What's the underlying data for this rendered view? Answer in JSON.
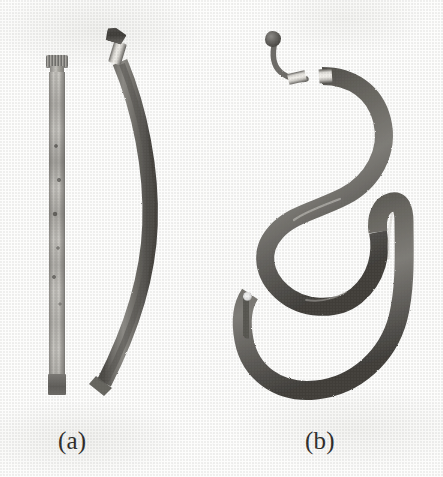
{
  "figure": {
    "kind": "grayscale-photograph-plate",
    "background_color": "#fdfdfc",
    "width": 443,
    "height": 477,
    "panels": [
      {
        "id": "a",
        "caption": "(a)",
        "objects": [
          {
            "name": "straight-rigid-rod",
            "description": "long slender straight tube / rod shown vertically, mottled grey metal surface with fine longitudinal striations and dark pitting spots",
            "orientation": "vertical",
            "features": [
              "knurled-threaded-cap-top",
              "narrow-neck",
              "striated-shaft",
              "blunt-dark-foot"
            ],
            "colors": {
              "shaft_light": "#cbc9c4",
              "shaft_mid": "#a8a6a1",
              "shaft_dark": "#76746f",
              "cap": "#8a8884",
              "foot": "#5e5c58"
            }
          },
          {
            "name": "gently-curved-flexible-hose",
            "description": "flexible hose bent into a single shallow arc, dark grey braided surface, bright metal ferrule and dark angled fitting at the upper end, diagonally cut free end at the lower left",
            "orientation": "arc-bowing-right",
            "features": [
              "angled-dark-fitting-top",
              "bright-metal-ferrule",
              "braided-dark-body",
              "diagonal-cut-lower-end"
            ],
            "colors": {
              "hose_dark": "#5a5853",
              "hose_mid": "#716f6a",
              "hose_light": "#8e8c87",
              "ferrule": "#f2f0eb"
            }
          }
        ]
      },
      {
        "id": "b",
        "caption": "(b)",
        "objects": [
          {
            "name": "serpentine-flexible-hose",
            "description": "the same flexible hose formed into a tight serpentine: a small crank at the top ending in a bulbous end fitting, two reverse S bends, then a large open loop at the bottom that doubles back on itself",
            "orientation": "serpentine-s-curve-with-bottom-loop",
            "features": [
              "bulbous-end-fitting",
              "thin-neck-segment",
              "two-metal-ferrules",
              "double-s-bend",
              "large-bottom-loop",
              "free-cut-end-with-highlight"
            ],
            "colors": {
              "hose_dark": "#4f4d49",
              "hose_mid": "#6a6864",
              "hose_light": "#8b8985",
              "ferrule": "#f6f4ef",
              "end_fitting": "#5d5b57"
            }
          }
        ]
      }
    ]
  },
  "captions": {
    "a": "(a)",
    "b": "(b)"
  }
}
